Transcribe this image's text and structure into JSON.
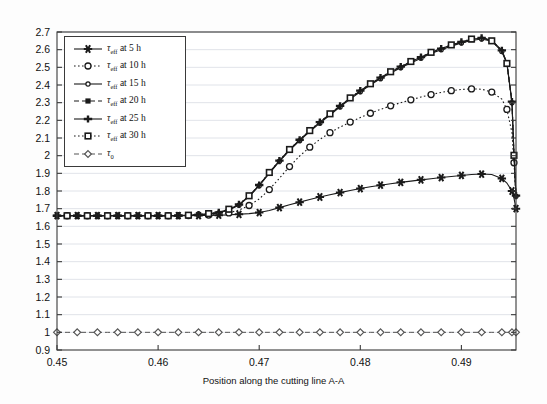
{
  "chart_data": {
    "type": "line",
    "title": "",
    "xlabel": "Position along the cutting line A-A",
    "ylabel": "",
    "xlim": [
      0.45,
      0.4954
    ],
    "ylim": [
      0.9,
      2.7
    ],
    "xticks": [
      "0.45",
      "0.46",
      "0.47",
      "0.48",
      "0.49"
    ],
    "xtick_values": [
      0.45,
      0.46,
      0.47,
      0.48,
      0.49
    ],
    "yticks": [
      "0.9",
      "1",
      "1.1",
      "1.2",
      "1.3",
      "1.4",
      "1.5",
      "1.6",
      "1.7",
      "1.8",
      "1.9",
      "2",
      "2.1",
      "2.2",
      "2.3",
      "2.4",
      "2.5",
      "2.6",
      "2.7"
    ],
    "ytick_values": [
      0.9,
      1.0,
      1.1,
      1.2,
      1.3,
      1.4,
      1.5,
      1.6,
      1.7,
      1.8,
      1.9,
      2.0,
      2.1,
      2.2,
      2.3,
      2.4,
      2.5,
      2.6,
      2.7
    ],
    "grid": "horizontal",
    "legend_position": "upper-left",
    "x": [
      0.45,
      0.451,
      0.452,
      0.453,
      0.454,
      0.455,
      0.456,
      0.457,
      0.458,
      0.459,
      0.46,
      0.461,
      0.462,
      0.463,
      0.464,
      0.465,
      0.466,
      0.467,
      0.468,
      0.469,
      0.47,
      0.471,
      0.472,
      0.473,
      0.474,
      0.475,
      0.476,
      0.477,
      0.478,
      0.479,
      0.48,
      0.481,
      0.482,
      0.483,
      0.484,
      0.485,
      0.486,
      0.487,
      0.488,
      0.489,
      0.49,
      0.491,
      0.492,
      0.493,
      0.494,
      0.4945,
      0.495,
      0.4952,
      0.4954
    ],
    "series": [
      {
        "name": "tau_eff at 5 h",
        "label": "5 h",
        "marker": "asterisk",
        "linestyle": "solid",
        "values": [
          1.66,
          1.66,
          1.66,
          1.66,
          1.66,
          1.66,
          1.66,
          1.66,
          1.66,
          1.66,
          1.66,
          1.66,
          1.66,
          1.66,
          1.661,
          1.662,
          1.663,
          1.665,
          1.668,
          1.672,
          1.678,
          1.69,
          1.706,
          1.722,
          1.737,
          1.752,
          1.766,
          1.779,
          1.791,
          1.803,
          1.814,
          1.824,
          1.833,
          1.841,
          1.849,
          1.856,
          1.863,
          1.869,
          1.876,
          1.882,
          1.888,
          1.893,
          1.896,
          1.893,
          1.871,
          1.845,
          1.8,
          1.76,
          1.7
        ]
      },
      {
        "name": "tau_eff at 10 h",
        "label": "10 h",
        "marker": "circle-open",
        "linestyle": "dotted",
        "values": [
          1.66,
          1.66,
          1.66,
          1.66,
          1.66,
          1.66,
          1.66,
          1.66,
          1.66,
          1.66,
          1.66,
          1.66,
          1.66,
          1.661,
          1.662,
          1.664,
          1.668,
          1.676,
          1.692,
          1.718,
          1.755,
          1.808,
          1.872,
          1.938,
          1.998,
          2.048,
          2.092,
          2.13,
          2.162,
          2.19,
          2.216,
          2.24,
          2.262,
          2.282,
          2.3,
          2.316,
          2.332,
          2.346,
          2.358,
          2.368,
          2.375,
          2.378,
          2.376,
          2.36,
          2.32,
          2.262,
          2.13,
          1.96,
          1.78
        ]
      },
      {
        "name": "tau_eff at 15 h",
        "label": "15 h",
        "marker": "circle-small",
        "linestyle": "solid",
        "values": [
          1.66,
          1.66,
          1.66,
          1.66,
          1.66,
          1.66,
          1.66,
          1.66,
          1.66,
          1.66,
          1.66,
          1.66,
          1.661,
          1.662,
          1.664,
          1.668,
          1.676,
          1.692,
          1.72,
          1.768,
          1.83,
          1.9,
          1.968,
          2.03,
          2.085,
          2.136,
          2.184,
          2.23,
          2.276,
          2.32,
          2.362,
          2.4,
          2.436,
          2.468,
          2.498,
          2.525,
          2.552,
          2.578,
          2.6,
          2.62,
          2.638,
          2.652,
          2.66,
          2.648,
          2.59,
          2.52,
          2.3,
          2.0,
          1.77
        ]
      },
      {
        "name": "tau_eff at 20 h",
        "label": "20 h",
        "marker": "square-filled",
        "linestyle": "dashed",
        "values": [
          1.66,
          1.66,
          1.66,
          1.66,
          1.66,
          1.66,
          1.66,
          1.66,
          1.66,
          1.66,
          1.66,
          1.66,
          1.661,
          1.662,
          1.665,
          1.67,
          1.678,
          1.694,
          1.722,
          1.77,
          1.832,
          1.902,
          1.97,
          2.032,
          2.088,
          2.139,
          2.188,
          2.234,
          2.28,
          2.324,
          2.366,
          2.404,
          2.44,
          2.472,
          2.502,
          2.53,
          2.556,
          2.582,
          2.604,
          2.624,
          2.642,
          2.656,
          2.665,
          2.652,
          2.594,
          2.524,
          2.304,
          2.004,
          1.772
        ]
      },
      {
        "name": "tau_eff at 25 h",
        "label": "25 h",
        "marker": "plus-filled",
        "linestyle": "solid",
        "values": [
          1.66,
          1.66,
          1.66,
          1.66,
          1.66,
          1.66,
          1.66,
          1.66,
          1.66,
          1.66,
          1.66,
          1.66,
          1.661,
          1.663,
          1.666,
          1.671,
          1.679,
          1.696,
          1.724,
          1.772,
          1.834,
          1.904,
          1.972,
          2.034,
          2.09,
          2.141,
          2.19,
          2.236,
          2.282,
          2.326,
          2.368,
          2.406,
          2.442,
          2.474,
          2.504,
          2.532,
          2.558,
          2.584,
          2.606,
          2.626,
          2.644,
          2.658,
          2.667,
          2.654,
          2.596,
          2.526,
          2.306,
          2.006,
          1.774
        ]
      },
      {
        "name": "tau_eff at 30 h",
        "label": "30 h",
        "marker": "square-open",
        "linestyle": "dotted",
        "values": [
          1.66,
          1.66,
          1.66,
          1.66,
          1.66,
          1.66,
          1.66,
          1.66,
          1.66,
          1.66,
          1.66,
          1.66,
          1.661,
          1.663,
          1.666,
          1.672,
          1.68,
          1.697,
          1.725,
          1.773,
          1.835,
          1.905,
          1.973,
          2.035,
          2.091,
          2.142,
          2.191,
          2.237,
          2.283,
          2.327,
          2.369,
          2.407,
          2.443,
          2.475,
          2.505,
          2.533,
          2.559,
          2.585,
          2.607,
          2.627,
          2.645,
          2.66,
          2.668,
          2.65,
          2.592,
          2.522,
          2.302,
          2.002,
          1.77
        ]
      },
      {
        "name": "tau_0",
        "label": "tau_0",
        "marker": "diamond-open",
        "linestyle": "dashed",
        "values": [
          1.0,
          1.0,
          1.0,
          1.0,
          1.0,
          1.0,
          1.0,
          1.0,
          1.0,
          1.0,
          1.0,
          1.0,
          1.0,
          1.0,
          1.0,
          1.0,
          1.0,
          1.0,
          1.0,
          1.0,
          1.0,
          1.0,
          1.0,
          1.0,
          1.0,
          1.0,
          1.0,
          1.0,
          1.0,
          1.0,
          1.0,
          1.0,
          1.0,
          1.0,
          1.0,
          1.0,
          1.0,
          1.0,
          1.0,
          1.0,
          1.0,
          1.0,
          1.0,
          1.0,
          1.0,
          1.0,
          1.0,
          1.0,
          1.0
        ]
      }
    ]
  },
  "legend": {
    "entries": [
      {
        "symbol": "tau",
        "sub": "eff",
        "rest": " at 5 h"
      },
      {
        "symbol": "tau",
        "sub": "eff",
        "rest": " at 10 h"
      },
      {
        "symbol": "tau",
        "sub": "eff",
        "rest": " at 15 h"
      },
      {
        "symbol": "tau",
        "sub": "eff",
        "rest": " at 20 h"
      },
      {
        "symbol": "tau",
        "sub": "eff",
        "rest": " at 25 h"
      },
      {
        "symbol": "tau",
        "sub": "eff",
        "rest": " at 30 h"
      },
      {
        "symbol": "tau",
        "sub": "0",
        "rest": ""
      }
    ],
    "texts": [
      "τeff at 5 h",
      "τeff at 10 h",
      "τeff at 15 h",
      "τeff at 20 h",
      "τeff at 25 h",
      "τeff at 30 h",
      "τ0"
    ]
  },
  "colors": {
    "line": "#1a1a1a",
    "grid": "#d8dce3",
    "axis": "#3a3a3a",
    "background": "#fdfdfd",
    "plot_background": "#ffffff",
    "text": "#111111"
  }
}
